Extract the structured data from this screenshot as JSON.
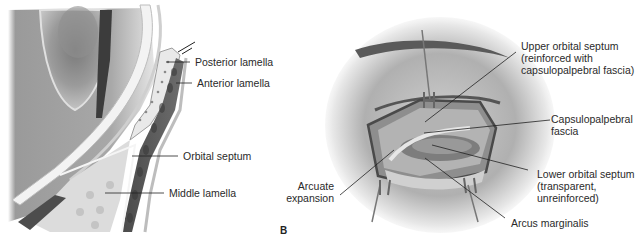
{
  "figure": {
    "panel_a": {
      "labels": [
        {
          "id": "posterior-lamella",
          "text": "Posterior lamella"
        },
        {
          "id": "anterior-lamella",
          "text": "Anterior lamella"
        },
        {
          "id": "orbital-septum",
          "text": "Orbital septum"
        },
        {
          "id": "middle-lamella",
          "text": "Middle lamella"
        }
      ]
    },
    "panel_b": {
      "letter": "B",
      "labels": [
        {
          "id": "upper-orbital-septum",
          "lines": [
            "Upper orbital septum",
            "(reinforced with",
            "capsulopalpebral fascia)"
          ]
        },
        {
          "id": "capsulopalpebral-fascia",
          "lines": [
            "Capsulopalpebral",
            "fascia"
          ]
        },
        {
          "id": "lower-orbital-septum",
          "lines": [
            "Lower orbital septum",
            "(transparent,",
            "unreinforced)"
          ]
        },
        {
          "id": "arcus-marginalis",
          "lines": [
            "Arcus marginalis"
          ]
        },
        {
          "id": "arcuate-expansion",
          "lines": [
            "Arcuate",
            "expansion"
          ]
        }
      ]
    },
    "colors": {
      "ink": "#2a2a2a",
      "dark_tissue": "#555555",
      "mid_tissue": "#8a8a8a",
      "light_tissue": "#d8d8d8",
      "background": "#ffffff"
    }
  }
}
